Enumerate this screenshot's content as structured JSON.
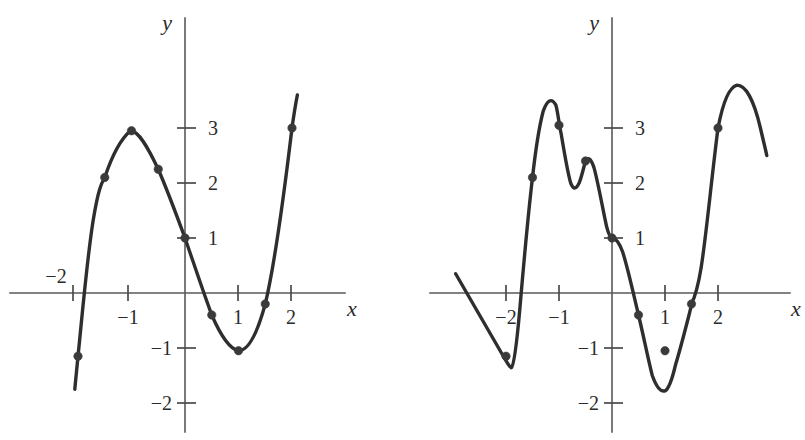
{
  "figure": {
    "background_color": "#ffffff",
    "curve_color": "#2e2e2e",
    "axis_color": "#595959",
    "point_color": "#3a3a3a"
  },
  "chart_data": [
    {
      "type": "line",
      "name": "left-graph",
      "title": "",
      "xlabel": "x",
      "ylabel": "y",
      "xlim": [
        -2.45,
        2.45
      ],
      "ylim": [
        -2.45,
        3.6
      ],
      "grid": false,
      "legend": "none",
      "xticks": [
        -2,
        -1,
        1,
        2
      ],
      "xticklabels": [
        "−2",
        "−1",
        "1",
        "2"
      ],
      "yticks": [
        -2,
        -1,
        1,
        2,
        3
      ],
      "yticklabels": [
        "−2",
        "−1",
        "1",
        "2",
        "3"
      ],
      "x": [
        -2.0,
        -1.5,
        -1.0,
        -0.5,
        0.0,
        0.5,
        1.0,
        1.5,
        2.0
      ],
      "values": [
        -1.15,
        2.1,
        2.95,
        2.25,
        1.0,
        -0.4,
        -1.05,
        -0.2,
        3.0
      ],
      "marked_points": [
        {
          "x": -2.0,
          "y": -1.15
        },
        {
          "x": -1.5,
          "y": 2.1
        },
        {
          "x": -1.0,
          "y": 2.95
        },
        {
          "x": -0.5,
          "y": 2.25
        },
        {
          "x": 0.0,
          "y": 1.0
        },
        {
          "x": 0.5,
          "y": -0.4
        },
        {
          "x": 1.0,
          "y": -1.05
        },
        {
          "x": 1.5,
          "y": -0.2
        },
        {
          "x": 2.0,
          "y": 3.0
        }
      ],
      "curve_path": "M -2.06 -1.75 L -2.0 -1.15 C -1.93 -0.5 -1.84 0.55 -1.72 1.3 C -1.62 1.9 -1.56 2.0 -1.5 2.1 C -1.38 2.45 -1.2 2.8 -1.02 2.95 C -0.86 2.95 -0.68 2.62 -0.5 2.25 C -0.33 1.87 -0.17 1.45 0.0 1.0 C 0.17 0.52 0.33 0.05 0.5 -0.4 C 0.67 -0.78 0.84 -1.02 1.0 -1.05 C 1.2 -1.05 1.36 -0.7 1.5 -0.2 C 1.66 0.45 1.84 1.7 2.0 3.0 C 2.05 3.35 2.08 3.5 2.1 3.6"
    },
    {
      "type": "line",
      "name": "right-graph",
      "title": "",
      "xlabel": "x",
      "ylabel": "y",
      "xlim": [
        -3.0,
        2.95
      ],
      "ylim": [
        -2.45,
        3.9
      ],
      "grid": false,
      "legend": "none",
      "xticks": [
        -2,
        -1,
        1,
        2
      ],
      "xticklabels": [
        "−2",
        "−1",
        "1",
        "2"
      ],
      "yticks": [
        -2,
        -1,
        1,
        2,
        3
      ],
      "yticklabels": [
        "−2",
        "−1",
        "1",
        "2",
        "3"
      ],
      "x": [
        -2.0,
        -1.5,
        -1.0,
        -0.5,
        0.0,
        0.5,
        1.0,
        1.5,
        2.0
      ],
      "values": [
        -1.15,
        2.1,
        3.05,
        2.4,
        1.0,
        -0.4,
        -1.05,
        -0.2,
        3.0
      ],
      "marked_points": [
        {
          "x": -2.0,
          "y": -1.15
        },
        {
          "x": -1.5,
          "y": 2.1
        },
        {
          "x": -1.0,
          "y": 3.05
        },
        {
          "x": -0.5,
          "y": 2.4
        },
        {
          "x": 0.0,
          "y": 1.0
        },
        {
          "x": 0.5,
          "y": -0.4
        },
        {
          "x": 1.0,
          "y": -1.05
        },
        {
          "x": 1.5,
          "y": -0.2
        },
        {
          "x": 2.0,
          "y": 3.0
        }
      ],
      "curve_path": "M -2.95 0.35 L -2.05 -1.15 C -1.98 -1.26 -1.94 -1.34 -1.9 -1.36 C -1.85 -1.32 -1.8 -0.95 -1.74 -0.3 C -1.66 0.6 -1.58 1.45 -1.5 2.1 C -1.44 2.62 -1.38 3.0 -1.3 3.3 C -1.22 3.52 -1.14 3.55 -1.06 3.42 C -1.02 3.3 -1.0 3.05 -0.96 2.9 C -0.9 2.55 -0.84 2.2 -0.78 2.0 C -0.73 1.88 -0.68 1.88 -0.62 2.0 C -0.57 2.12 -0.53 2.3 -0.5 2.4 C -0.45 2.48 -0.4 2.45 -0.34 2.28 C -0.26 2.0 -0.18 1.55 -0.1 1.2 C -0.06 1.06 -0.03 1.0 0.0 1.0 C 0.07 1.0 0.13 0.93 0.2 0.75 C 0.3 0.45 0.4 0.0 0.5 -0.4 C 0.6 -0.8 0.68 -1.2 0.76 -1.5 C 0.84 -1.72 0.92 -1.8 1.0 -1.78 C 1.08 -1.74 1.14 -1.55 1.2 -1.3 C 1.28 -1.05 1.36 -0.75 1.44 -0.45 C 1.48 -0.3 1.5 -0.22 1.5 -0.2 C 1.56 -0.08 1.62 0.1 1.68 0.45 C 1.78 1.05 1.88 2.1 2.0 3.0 C 2.1 3.5 2.22 3.75 2.36 3.78 C 2.52 3.78 2.68 3.5 2.8 3.0 C 2.86 2.75 2.9 2.6 2.92 2.5"
    }
  ],
  "labels": {
    "x_axis": "x",
    "y_axis": "y",
    "neg_two": "−2",
    "neg_one": "−1",
    "one": "1",
    "two": "2",
    "three": "3"
  }
}
